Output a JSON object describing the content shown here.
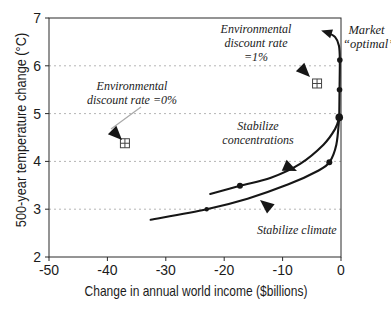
{
  "chart_data": {
    "type": "line",
    "title": "",
    "xlabel": "Change in annual world income ($billions)",
    "ylabel": "500-year temperature change (°C)",
    "xlim": [
      -50,
      0
    ],
    "ylim": [
      2,
      7
    ],
    "x_ticks": [
      -50,
      -40,
      -30,
      -20,
      -10,
      0
    ],
    "y_ticks": [
      7,
      6,
      5,
      4,
      3,
      2
    ],
    "gridlines_y": [
      3,
      4,
      5,
      6
    ],
    "grid_style": "dashed-horizontal",
    "legend_position": "annotated-on-plot",
    "series": [
      {
        "name": "Stabilize concentrations",
        "points": [
          [
            -22.4,
            3.32
          ],
          [
            -17.3,
            3.49
          ],
          [
            -12,
            3.66
          ],
          [
            -7,
            3.95
          ],
          [
            -3,
            4.35
          ],
          [
            -1,
            4.68
          ],
          [
            -0.3,
            4.92
          ]
        ],
        "markers": [
          [
            -17.3,
            3.49,
            3
          ]
        ]
      },
      {
        "name": "Stabilize climate",
        "points": [
          [
            -32.6,
            2.78
          ],
          [
            -23,
            3.0
          ],
          [
            -16,
            3.22
          ],
          [
            -9,
            3.52
          ],
          [
            -4,
            3.8
          ],
          [
            -2,
            3.98
          ],
          [
            -0.8,
            4.35
          ],
          [
            -0.3,
            4.92
          ]
        ],
        "markers": [
          [
            -23,
            3.0,
            2.2
          ],
          [
            -2,
            3.98,
            3
          ]
        ]
      },
      {
        "name": "Market “optimal” path",
        "points": [
          [
            -0.3,
            4.92
          ],
          [
            -0.25,
            5.5
          ],
          [
            -0.2,
            6.12
          ],
          [
            -0.35,
            6.42
          ],
          [
            -1.0,
            6.6
          ],
          [
            -2.4,
            6.7
          ]
        ],
        "markers": [
          [
            -0.3,
            4.92,
            3.8
          ],
          [
            -0.25,
            5.5,
            2.8
          ],
          [
            -0.2,
            6.12,
            2.8
          ]
        ],
        "arrow_tip": [
          -3.4,
          6.74
        ]
      }
    ],
    "special_points": [
      {
        "label": "Environmental discount rate =0%",
        "x": -37,
        "y": 4.38,
        "marker": "square-plus"
      },
      {
        "label": "Environmental discount rate =1%",
        "x": -4.1,
        "y": 5.63,
        "marker": "square-plus"
      }
    ],
    "annotations": {
      "env0": {
        "line1": "Environmental",
        "line2": "discount rate =0%"
      },
      "env1": {
        "line1": "Environmental",
        "line2": "discount rate =1%"
      },
      "market": {
        "line1": "Market",
        "line2": "“optimal”"
      },
      "concentrations": {
        "line1": "Stabilize",
        "line2": "concentrations"
      },
      "climate": {
        "line1": "Stabilize climate"
      }
    }
  },
  "colors": {
    "curve": "#161616",
    "axis": "#2a2a2a",
    "grid": "#b5b5b5",
    "leader": "#a8a8a8",
    "text": "#1b1b1b",
    "background": "#ffffff"
  }
}
